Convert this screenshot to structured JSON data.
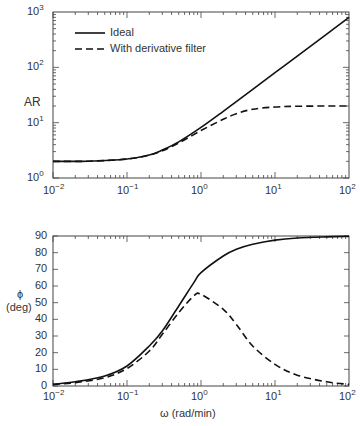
{
  "chart_data": [
    {
      "type": "line",
      "title": "",
      "xlabel": "",
      "ylabel": "AR",
      "xscale": "log",
      "yscale": "log",
      "xlim": [
        0.01,
        100
      ],
      "ylim": [
        1,
        1000
      ],
      "x_tick_labels": [
        "10^-2",
        "10^-1",
        "10^0",
        "10^1",
        "10^2"
      ],
      "y_tick_labels": [
        "10^0",
        "10^1",
        "10^2",
        "10^3"
      ],
      "legend": {
        "position": "upper left",
        "entries": [
          "Ideal",
          "With derivative filter"
        ]
      },
      "grid": false,
      "x": [
        0.01,
        0.03,
        0.1,
        0.2,
        0.3,
        0.5,
        1,
        2,
        3,
        5,
        10,
        20,
        50,
        100
      ],
      "series": [
        {
          "name": "Ideal",
          "style": "solid",
          "values": [
            2.0,
            2.01,
            2.2,
            2.6,
            3.2,
            4.5,
            8.2,
            16,
            24,
            40,
            80,
            160,
            400,
            800
          ]
        },
        {
          "name": "With derivative filter",
          "style": "dashed",
          "values": [
            2.0,
            2.01,
            2.2,
            2.6,
            3.1,
            4.3,
            7.2,
            11.5,
            14.5,
            17.5,
            19.2,
            19.8,
            20,
            20
          ]
        }
      ]
    },
    {
      "type": "line",
      "title": "",
      "xlabel": "ω (rad/min)",
      "ylabel": "ϕ (deg)",
      "xscale": "log",
      "xlim": [
        0.01,
        100
      ],
      "ylim": [
        0,
        90
      ],
      "x_tick_labels": [
        "10^-2",
        "10^-1",
        "10^0",
        "10^1",
        "10^2"
      ],
      "y_ticks": [
        0,
        10,
        20,
        30,
        40,
        50,
        60,
        70,
        80,
        90
      ],
      "grid": false,
      "x": [
        0.01,
        0.02,
        0.05,
        0.1,
        0.2,
        0.3,
        0.5,
        0.8,
        1,
        2,
        3,
        5,
        10,
        20,
        50,
        100
      ],
      "series": [
        {
          "name": "Ideal",
          "style": "solid",
          "values": [
            1,
            2.5,
            6,
            12,
            24,
            33,
            48,
            62,
            68,
            78,
            82,
            85,
            87.5,
            88.8,
            89.5,
            89.8
          ]
        },
        {
          "name": "With derivative filter",
          "style": "dashed",
          "values": [
            1,
            2,
            5,
            10.5,
            21,
            31,
            44,
            54,
            55,
            46,
            37,
            24,
            13,
            6.5,
            2.5,
            1
          ]
        }
      ]
    }
  ],
  "top": {
    "ylabel": "AR",
    "yticks": [
      {
        "base": "10",
        "exp": "3"
      },
      {
        "base": "10",
        "exp": "2"
      },
      {
        "base": "10",
        "exp": "1"
      },
      {
        "base": "10",
        "exp": "0"
      }
    ],
    "xticks": [
      {
        "base": "10",
        "exp": "−2"
      },
      {
        "base": "10",
        "exp": "−1"
      },
      {
        "base": "10",
        "exp": "0"
      },
      {
        "base": "10",
        "exp": "1"
      },
      {
        "base": "10",
        "exp": "2"
      }
    ],
    "legend": [
      "Ideal",
      "With derivative filter"
    ]
  },
  "bottom": {
    "ylabel1": "ϕ",
    "ylabel2": "(deg)",
    "yticks": [
      "90",
      "80",
      "70",
      "60",
      "50",
      "40",
      "30",
      "20",
      "10",
      "0"
    ],
    "xticks": [
      {
        "base": "10",
        "exp": "−2"
      },
      {
        "base": "10",
        "exp": "−1"
      },
      {
        "base": "10",
        "exp": "0"
      },
      {
        "base": "10",
        "exp": "1"
      },
      {
        "base": "10",
        "exp": "2"
      }
    ],
    "xlabel": "ω (rad/min)"
  }
}
